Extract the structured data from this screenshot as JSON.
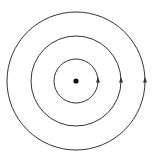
{
  "diagram": {
    "center": {
      "x": 76,
      "y": 81,
      "dot_radius": 2.6
    },
    "orbits": [
      {
        "radius": 22,
        "arrow_direction": "up"
      },
      {
        "radius": 45,
        "arrow_direction": "up"
      },
      {
        "radius": 69,
        "arrow_direction": "up"
      }
    ],
    "stroke_color": "#333333",
    "background": "#ffffff"
  }
}
